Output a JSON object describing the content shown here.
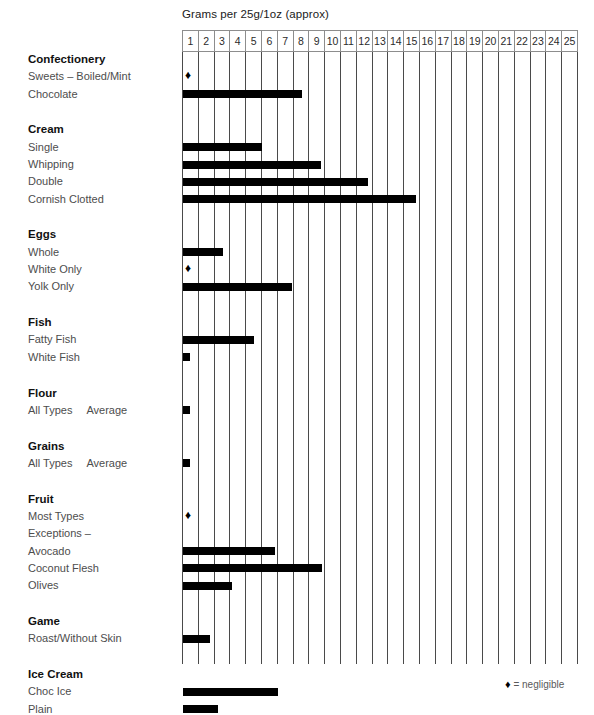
{
  "axis": {
    "title": "Grams per 25g/1oz (approx)",
    "ticks": [
      "1",
      "2",
      "3",
      "4",
      "5",
      "6",
      "7",
      "8",
      "9",
      "10",
      "11",
      "12",
      "13",
      "14",
      "15",
      "16",
      "17",
      "18",
      "19",
      "20",
      "21",
      "22",
      "23",
      "24",
      "25"
    ],
    "min": 0,
    "max": 25
  },
  "legend": {
    "diamond": "♦",
    "text": "= negligible"
  },
  "groups": [
    {
      "name": "Confectionery",
      "rows": [
        {
          "label": "Sweets – Boiled/Mint",
          "value": 0,
          "negligible": true
        },
        {
          "label": "Chocolate",
          "value": 7.5,
          "negligible": false
        }
      ]
    },
    {
      "name": "Cream",
      "rows": [
        {
          "label": "Single",
          "value": 5.0,
          "negligible": false
        },
        {
          "label": "Whipping",
          "value": 8.7,
          "negligible": false
        },
        {
          "label": "Double",
          "value": 11.7,
          "negligible": false
        },
        {
          "label": "Cornish Clotted",
          "value": 14.7,
          "negligible": false
        }
      ]
    },
    {
      "name": "Eggs",
      "rows": [
        {
          "label": "Whole",
          "value": 2.5,
          "negligible": false
        },
        {
          "label": "White Only",
          "value": 0,
          "negligible": true
        },
        {
          "label": "Yolk Only",
          "value": 6.9,
          "negligible": false
        }
      ]
    },
    {
      "name": "Fish",
      "rows": [
        {
          "label": "Fatty Fish",
          "value": 4.5,
          "negligible": false
        },
        {
          "label": "White Fish",
          "value": 0.45,
          "negligible": false
        }
      ]
    },
    {
      "name": "Flour",
      "rows": [
        {
          "label": "All Types",
          "label2": "Average",
          "value": 0.45,
          "negligible": false
        }
      ]
    },
    {
      "name": "Grains",
      "rows": [
        {
          "label": "All Types",
          "label2": "Average",
          "value": 0.45,
          "negligible": false
        }
      ]
    },
    {
      "name": "Fruit",
      "rows": [
        {
          "label": "Most Types",
          "value": 0,
          "negligible": true
        },
        {
          "label": "Exceptions –",
          "value": null,
          "negligible": false
        },
        {
          "label": "Avocado",
          "value": 5.8,
          "negligible": false
        },
        {
          "label": "Coconut Flesh",
          "value": 8.8,
          "negligible": false
        },
        {
          "label": "Olives",
          "value": 3.1,
          "negligible": false
        }
      ]
    },
    {
      "name": "Game",
      "rows": [
        {
          "label": "Roast/Without Skin",
          "value": 1.7,
          "negligible": false
        }
      ]
    },
    {
      "name": "Ice Cream",
      "rows": [
        {
          "label": "Choc Ice",
          "value": 6.0,
          "negligible": false
        },
        {
          "label": "Plain",
          "value": 2.2,
          "negligible": false
        }
      ]
    }
  ],
  "chart_data": {
    "type": "bar",
    "orientation": "horizontal",
    "title": "Grams per 25g/1oz (approx)",
    "xlabel": "Grams per 25g/1oz (approx)",
    "ylabel": "",
    "xlim": [
      0,
      25
    ],
    "grid": true,
    "legend_position": "bottom-right",
    "legend_entries": [
      "♦ = negligible"
    ],
    "categories": [
      "Confectionery: Sweets – Boiled/Mint",
      "Confectionery: Chocolate",
      "Cream: Single",
      "Cream: Whipping",
      "Cream: Double",
      "Cream: Cornish Clotted",
      "Eggs: Whole",
      "Eggs: White Only",
      "Eggs: Yolk Only",
      "Fish: Fatty Fish",
      "Fish: White Fish",
      "Flour: All Types Average",
      "Grains: All Types Average",
      "Fruit: Most Types",
      "Fruit: Avocado",
      "Fruit: Coconut Flesh",
      "Fruit: Olives",
      "Game: Roast/Without Skin",
      "Ice Cream: Choc Ice",
      "Ice Cream: Plain"
    ],
    "values": [
      0,
      7.5,
      5.0,
      8.7,
      11.7,
      14.7,
      2.5,
      0,
      6.9,
      4.5,
      0.45,
      0.45,
      0.45,
      0,
      5.8,
      8.8,
      3.1,
      1.7,
      6.0,
      2.2
    ],
    "negligible_flags": [
      true,
      false,
      false,
      false,
      false,
      false,
      false,
      true,
      false,
      false,
      false,
      false,
      false,
      true,
      false,
      false,
      false,
      false,
      false,
      false
    ],
    "tick_labels": [
      "1",
      "2",
      "3",
      "4",
      "5",
      "6",
      "7",
      "8",
      "9",
      "10",
      "11",
      "12",
      "13",
      "14",
      "15",
      "16",
      "17",
      "18",
      "19",
      "20",
      "21",
      "22",
      "23",
      "24",
      "25"
    ]
  }
}
